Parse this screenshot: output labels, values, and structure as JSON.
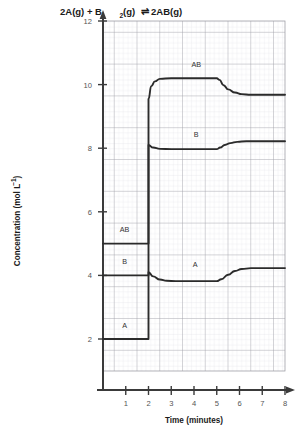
{
  "chart_data": {
    "type": "line",
    "title_parts": {
      "a": "2A(g) + B",
      "a_sub": "2",
      "b": "(g) ",
      "eq": "⇌",
      "c": " 2AB(g)"
    },
    "xlabel": "Time (minutes)",
    "ylabel": "Concentration (mol L",
    "ylabel_sup": "−1",
    "ylabel_tail": ")",
    "xlim": [
      0,
      8
    ],
    "ylim": [
      0,
      12
    ],
    "xticks": [
      1,
      2,
      3,
      4,
      5,
      6,
      7,
      8
    ],
    "yticks": [
      2,
      4,
      6,
      8,
      10,
      12
    ],
    "xtick_labels": [
      "1",
      "2",
      "3",
      "4",
      "5",
      "6",
      "7",
      "8"
    ],
    "ytick_labels": [
      "2",
      "4",
      "6",
      "8",
      "10",
      "12"
    ],
    "grid": true,
    "grid_minor": true,
    "legend": "inline-labels",
    "axis_color": "#3a3a3a",
    "grid_major_color": "#9a9aa2",
    "grid_minor_color": "#d8d8de",
    "curve_color": "#2b2b2b",
    "series": [
      {
        "name": "AB",
        "label": "AB",
        "label_x": 4.1,
        "label_y": 10.55,
        "points": [
          [
            0.0,
            5.0
          ],
          [
            2.0,
            5.0
          ],
          [
            2.0,
            9.55
          ],
          [
            2.12,
            9.95
          ],
          [
            2.28,
            10.1
          ],
          [
            2.5,
            10.18
          ],
          [
            3.0,
            10.2
          ],
          [
            4.0,
            10.2
          ],
          [
            5.0,
            10.2
          ],
          [
            5.12,
            10.15
          ],
          [
            5.3,
            9.98
          ],
          [
            5.5,
            9.85
          ],
          [
            5.8,
            9.75
          ],
          [
            6.1,
            9.7
          ],
          [
            6.5,
            9.68
          ],
          [
            7.0,
            9.68
          ],
          [
            8.0,
            9.68
          ]
        ],
        "initial_value": 5.0,
        "plateau_1": 10.2,
        "plateau_2": 9.7
      },
      {
        "name": "B",
        "label": "B",
        "label_x": 4.1,
        "label_y": 8.35,
        "points": [
          [
            0.0,
            4.0
          ],
          [
            2.0,
            4.0
          ],
          [
            2.0,
            8.1
          ],
          [
            2.2,
            8.02
          ],
          [
            2.5,
            7.98
          ],
          [
            3.0,
            7.97
          ],
          [
            4.0,
            7.97
          ],
          [
            5.0,
            7.97
          ],
          [
            5.15,
            8.02
          ],
          [
            5.35,
            8.1
          ],
          [
            5.6,
            8.16
          ],
          [
            5.9,
            8.2
          ],
          [
            6.3,
            8.22
          ],
          [
            7.0,
            8.22
          ],
          [
            8.0,
            8.22
          ]
        ],
        "initial_value": 4.0,
        "plateau_1": 8.0,
        "plateau_2": 8.2
      },
      {
        "name": "A",
        "label": "A",
        "label_x": 4.05,
        "label_y": 4.25,
        "points": [
          [
            0.0,
            2.0
          ],
          [
            2.0,
            2.0
          ],
          [
            2.0,
            4.1
          ],
          [
            2.2,
            3.97
          ],
          [
            2.5,
            3.87
          ],
          [
            2.8,
            3.83
          ],
          [
            3.2,
            3.82
          ],
          [
            4.0,
            3.82
          ],
          [
            5.0,
            3.82
          ],
          [
            5.2,
            3.88
          ],
          [
            5.5,
            4.02
          ],
          [
            5.8,
            4.14
          ],
          [
            6.1,
            4.2
          ],
          [
            6.5,
            4.23
          ],
          [
            7.0,
            4.23
          ],
          [
            8.0,
            4.23
          ]
        ],
        "initial_value": 2.0,
        "plateau_1": 3.85,
        "plateau_2": 4.22
      }
    ],
    "annotations": [
      {
        "text": "AB",
        "x": 0.95,
        "y": 5.35,
        "series": "AB-initial"
      },
      {
        "text": "B",
        "x": 0.95,
        "y": 4.35,
        "series": "B-initial"
      },
      {
        "text": "A",
        "x": 0.95,
        "y": 2.35,
        "series": "A-initial"
      }
    ],
    "events": [
      {
        "time": 2,
        "description": "disturbance: step change in concentrations"
      },
      {
        "time": 5,
        "description": "second disturbance: system re-equilibrates"
      }
    ]
  }
}
